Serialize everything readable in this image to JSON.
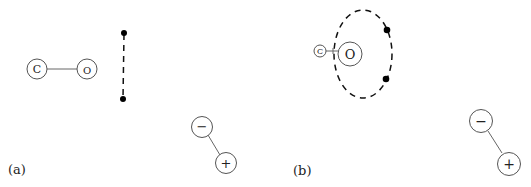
{
  "panels": [
    {
      "label": "(a)",
      "molecule": {
        "atoms": [
          {
            "symbol": "C"
          },
          {
            "symbol": "O"
          }
        ]
      },
      "electron_pair": {
        "style": "dashed-line",
        "endpoints": 2
      },
      "dipole": {
        "negative": "−",
        "positive": "+"
      }
    },
    {
      "label": "(b)",
      "molecule": {
        "atoms": [
          {
            "symbol": "C"
          },
          {
            "symbol": "O"
          }
        ]
      },
      "electron_pair": {
        "style": "dashed-ellipse",
        "dots": 2
      },
      "dipole": {
        "negative": "−",
        "positive": "+"
      }
    }
  ],
  "colors": {
    "stroke": "#555555",
    "dash": "#111111",
    "dot": "#000000",
    "background": "#ffffff"
  }
}
